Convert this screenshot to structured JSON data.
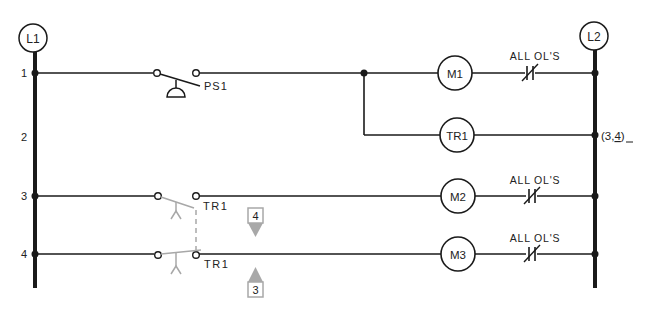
{
  "diagram": {
    "type": "ladder-logic",
    "rails": {
      "left": "L1",
      "right": "L2"
    },
    "rung_numbers": [
      "1",
      "2",
      "3",
      "4"
    ],
    "rungs": [
      {
        "number": "1",
        "contact": "PS1",
        "contact_type": "pressure-switch-NO",
        "coil": "M1",
        "overload": "ALL OL'S"
      },
      {
        "number": "2",
        "coil": "TR1",
        "cross_reference": "(3,4)"
      },
      {
        "number": "3",
        "contact": "TR1",
        "contact_type": "timed-NO-timed-open",
        "coil": "M2",
        "overload": "ALL OL'S"
      },
      {
        "number": "4",
        "contact": "TR1",
        "contact_type": "timed-NO-timed-open",
        "coil": "M3",
        "overload": "ALL OL'S"
      }
    ],
    "labels": {
      "l1": "L1",
      "l2": "L2",
      "ps1": "PS1",
      "m1": "M1",
      "tr1_coil": "TR1",
      "m2": "M2",
      "m3": "M3",
      "tr1_contact_3": "TR1",
      "tr1_contact_4": "TR1",
      "ol_1": "ALL OL'S",
      "ol_3": "ALL OL'S",
      "ol_4": "ALL OL'S",
      "xref": "(3,",
      "xref_underlined": "4",
      "xref_close": ")"
    },
    "indicators": [
      {
        "label": "4",
        "direction": "down"
      },
      {
        "label": "3",
        "direction": "up"
      }
    ],
    "colors": {
      "ink": "#1a1a1a",
      "gray": "#a8a8a8"
    }
  }
}
